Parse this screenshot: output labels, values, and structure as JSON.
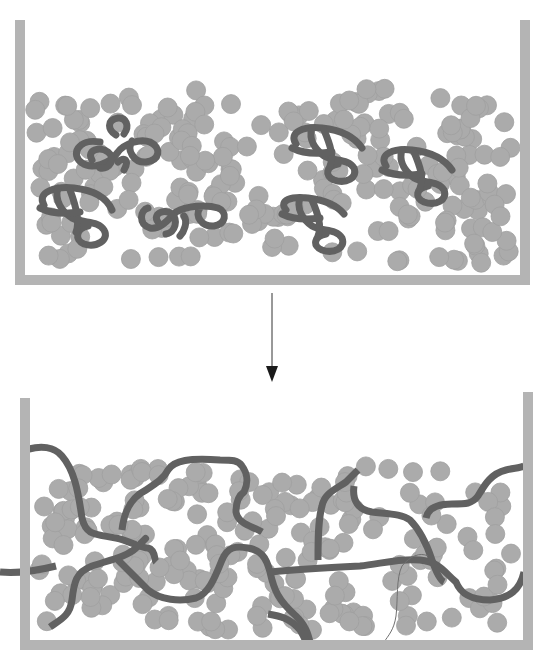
{
  "figure": {
    "colors": {
      "background": "#ffffff",
      "container": "#b4b4b4",
      "particle": "#ababab",
      "particle_stroke": "#9d9d9d",
      "polymer": "#616161",
      "arrow": "#1a1a1a",
      "thin_strand": "#707070"
    },
    "panels": [
      {
        "name": "before",
        "state": "coiled polymer chains",
        "coil_count": 7
      },
      {
        "name": "after",
        "state": "extended polymer chains",
        "chain_count": 7
      }
    ],
    "arrow": {
      "direction": "down"
    }
  }
}
